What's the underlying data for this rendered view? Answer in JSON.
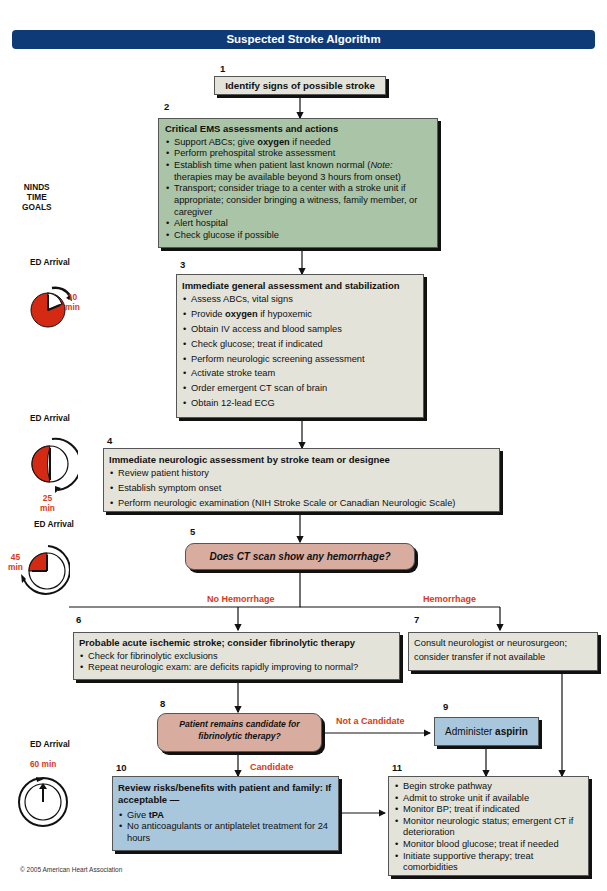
{
  "title": "Suspected Stroke Algorithm",
  "side": {
    "ninds_label": [
      "NINDS",
      "TIME",
      "GOALS"
    ],
    "clocks": [
      {
        "label": "ED Arrival",
        "time": "10",
        "unit": "min",
        "elapsed_minutes": 10
      },
      {
        "label": "ED Arrival",
        "time": "25",
        "unit": "min",
        "elapsed_minutes": 25
      },
      {
        "label": "ED Arrival",
        "time": "45",
        "unit": "min",
        "elapsed_minutes": 45
      },
      {
        "label": "ED Arrival",
        "time": "60 min",
        "unit": "",
        "elapsed_minutes": 60
      }
    ]
  },
  "steps": {
    "s1": {
      "num": "1",
      "text": "Identify signs of possible stroke"
    },
    "s2": {
      "num": "2",
      "title": "Critical EMS assessments and actions",
      "items": [
        {
          "pre": "Support ABCs; give ",
          "bold": "oxygen",
          "post": " if needed"
        },
        {
          "pre": "Perform prehospital stroke assessment",
          "bold": "",
          "post": ""
        },
        {
          "pre": "Establish time when patient last known normal (",
          "italic": "Note:",
          "post": " therapies may be available beyond 3 hours from onset)"
        },
        {
          "pre": "Transport; consider triage to a center with a stroke unit if appropriate; consider bringing a witness, family member, or caregiver",
          "bold": "",
          "post": ""
        },
        {
          "pre": "Alert hospital",
          "bold": "",
          "post": ""
        },
        {
          "pre": "Check glucose if possible",
          "bold": "",
          "post": ""
        }
      ]
    },
    "s3": {
      "num": "3",
      "title": "Immediate general assessment and stabilization",
      "items": [
        {
          "pre": "Assess ABCs, vital signs",
          "bold": "",
          "post": ""
        },
        {
          "pre": "Provide ",
          "bold": "oxygen",
          "post": " if hypoxemic"
        },
        {
          "pre": "Obtain IV access and blood samples",
          "bold": "",
          "post": ""
        },
        {
          "pre": "Check glucose; treat if indicated",
          "bold": "",
          "post": ""
        },
        {
          "pre": "Perform neurologic screening assessment",
          "bold": "",
          "post": ""
        },
        {
          "pre": "Activate stroke team",
          "bold": "",
          "post": ""
        },
        {
          "pre": "Order emergent CT scan of brain",
          "bold": "",
          "post": ""
        },
        {
          "pre": "Obtain 12-lead ECG",
          "bold": "",
          "post": ""
        }
      ]
    },
    "s4": {
      "num": "4",
      "title": "Immediate neurologic assessment by stroke team or designee",
      "items": [
        "Review patient history",
        "Establish symptom onset",
        "Perform neurologic examination (NIH Stroke Scale or Canadian Neurologic Scale)"
      ]
    },
    "s5": {
      "num": "5",
      "text": "Does CT scan show any hemorrhage?"
    },
    "s6": {
      "num": "6",
      "title": "Probable acute ischemic stroke; consider fibrinolytic therapy",
      "items": [
        "Check for fibrinolytic exclusions",
        "Repeat neurologic exam: are deficits rapidly improving to normal?"
      ]
    },
    "s7": {
      "num": "7",
      "text": "Consult neurologist or neurosurgeon; consider transfer if not available"
    },
    "s8": {
      "num": "8",
      "text": "Patient remains candidate for fibrinolytic therapy?"
    },
    "s9": {
      "num": "9",
      "pre": "Administer ",
      "bold": "aspirin"
    },
    "s10": {
      "num": "10",
      "title": "Review risks/benefits with patient and family: If acceptable —",
      "items": [
        {
          "pre": "Give ",
          "bold": "tPA"
        },
        {
          "pre": "No anticoagulants or antiplatelet treatment for 24 hours",
          "bold": ""
        }
      ]
    },
    "s11": {
      "num": "11",
      "items": [
        "Begin stroke pathway",
        "Admit to stroke unit if available",
        "Monitor BP; treat if indicated",
        "Monitor neurologic status; emergent CT if deterioration",
        "Monitor blood glucose; treat if needed",
        "Initiate supportive therapy; treat comorbidities"
      ]
    }
  },
  "branches": {
    "no_hemorrhage": "No Hemorrhage",
    "hemorrhage": "Hemorrhage",
    "not_candidate": "Not a Candidate",
    "candidate": "Candidate"
  },
  "colors": {
    "header": "#0e3a78",
    "branch_label": "#d43a1a",
    "clock_fill": "#d42a14",
    "box_gray": "#e3e3d9",
    "box_green": "#a9c4a6",
    "box_blue": "#a8c6dc",
    "box_pink": "#d9aca0"
  },
  "copyright": "© 2005 American Heart Association"
}
